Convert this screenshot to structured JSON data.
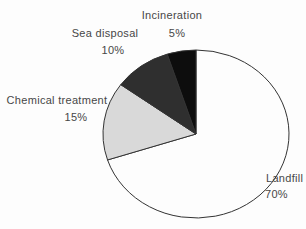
{
  "figure": {
    "background_color": "#fdfdfd",
    "text_color": "#474747"
  },
  "chart_data": {
    "type": "pie",
    "title": "",
    "direction": "clockwise",
    "start_angle_deg": 0,
    "legend_position": "labels-around-pie",
    "stroke_color": "#333333",
    "geometry": {
      "cx": 196,
      "cy": 134,
      "rx": 93,
      "ry": 84
    },
    "slices": [
      {
        "label": "Landfill",
        "value_pct": 70,
        "value_label": "70%",
        "color": "#fdfdfd"
      },
      {
        "label": "Chemical treatment",
        "value_pct": 15,
        "value_label": "15%",
        "color": "#d9d9d9"
      },
      {
        "label": "Sea disposal",
        "value_pct": 10,
        "value_label": "10%",
        "color": "#2f2f2f"
      },
      {
        "label": "Incineration",
        "value_pct": 5,
        "value_label": "5%",
        "color": "#0d0d0d"
      }
    ]
  }
}
